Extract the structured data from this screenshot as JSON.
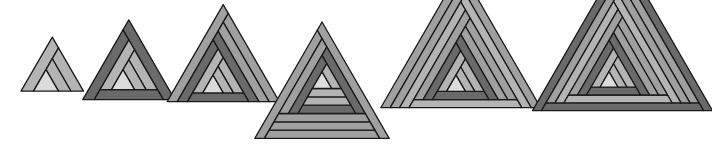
{
  "diagram": {
    "title": "",
    "palette": {
      "center": "#dcdcdc",
      "light": "#b4b4b4",
      "mid": "#a0a0a0",
      "dark": "#6a6a6a",
      "outline": "#1a1a1a",
      "background": "#ffffff"
    },
    "figures": [
      {
        "id": 1,
        "cx": 46,
        "cy": 84,
        "scale": 12.5,
        "strips": [
          "light",
          "light",
          "light"
        ]
      },
      {
        "id": 2,
        "cx": 123,
        "cy": 83,
        "scale": 11.5,
        "strips": [
          "light",
          "light",
          "light",
          "dark",
          "dark",
          "dark"
        ]
      },
      {
        "id": 3,
        "cx": 213,
        "cy": 87,
        "scale": 10.2,
        "strips": [
          "light",
          "light",
          "light",
          "dark",
          "dark",
          "dark",
          "mid",
          "mid",
          "mid"
        ]
      },
      {
        "id": 4,
        "cx": 322,
        "cy": 83,
        "scale": 9.6,
        "strips": [
          "light",
          "light",
          "light",
          "dark",
          "dark",
          "dark",
          "mid",
          "mid",
          "mid",
          "mid",
          "mid",
          "mid"
        ]
      },
      {
        "id": 5,
        "cx": 456,
        "cy": 86,
        "scale": 9.4,
        "strips": [
          "light",
          "light",
          "light",
          "dark",
          "dark",
          "dark",
          "mid",
          "mid",
          "mid",
          "light",
          "light",
          "light",
          "mid",
          "mid",
          "mid"
        ]
      },
      {
        "id": 6,
        "cx": 609,
        "cy": 82,
        "scale": 9.0,
        "strips": [
          "light",
          "light",
          "light",
          "dark",
          "dark",
          "dark",
          "mid",
          "mid",
          "mid",
          "light",
          "light",
          "light",
          "mid",
          "mid",
          "mid",
          "dark",
          "dark",
          "dark"
        ]
      }
    ]
  }
}
